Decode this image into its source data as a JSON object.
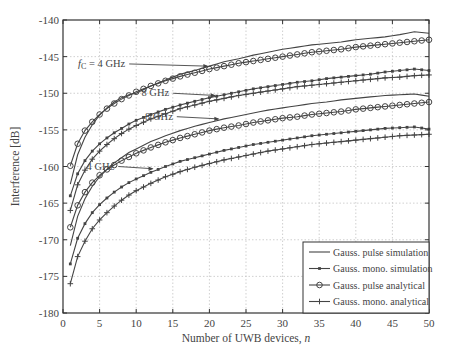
{
  "chart_data": {
    "type": "line",
    "title": "",
    "xlabel": "Number of UWB devices, n",
    "ylabel": "Interference [dB]",
    "xlim": [
      0,
      50
    ],
    "ylim": [
      -180,
      -140
    ],
    "xticks": [
      0,
      5,
      10,
      15,
      20,
      25,
      30,
      35,
      40,
      45,
      50
    ],
    "yticks": [
      -180,
      -175,
      -170,
      -165,
      -160,
      -155,
      -150,
      -145,
      -140
    ],
    "grid": true,
    "legend_position": "lower right",
    "legend": [
      {
        "label": "Gauss. pulse simulation",
        "marker": "none"
      },
      {
        "label": "Gauss. mono. simulation",
        "marker": "x"
      },
      {
        "label": "Gauss. pulse analytical",
        "marker": "o"
      },
      {
        "label": "Gauss. mono. analytical",
        "marker": "+"
      }
    ],
    "annotations": [
      {
        "text": "f_c = 4 GHz",
        "x": 20,
        "y": -146.3,
        "label_at": [
          8.5,
          -146.0
        ]
      },
      {
        "text": "8 GHz",
        "x": 21,
        "y": -150.3,
        "label_at": [
          14.5,
          -150.0
        ]
      },
      {
        "text": "8 GHz",
        "x": 21.5,
        "y": -153.5,
        "label_at": [
          15.0,
          -153.2
        ]
      },
      {
        "text": "4 GHz",
        "x": 12.5,
        "y": -160.3,
        "label_at": [
          7.0,
          -160.0
        ]
      }
    ],
    "x": [
      1,
      2,
      3,
      4,
      5,
      6,
      7,
      8,
      9,
      10,
      12,
      14,
      16,
      18,
      20,
      22,
      24,
      26,
      28,
      30,
      32,
      34,
      36,
      38,
      40,
      42,
      44,
      46,
      48,
      50
    ],
    "series": [
      {
        "name": "Gauss. pulse simulation (fc = 4 GHz)",
        "group": "fc=4 GHz pulse",
        "values": [
          -162.4,
          -158.4,
          -156.0,
          -154.3,
          -153.0,
          -152.0,
          -151.2,
          -150.6,
          -150.2,
          -150.0,
          -149.0,
          -148.2,
          -147.4,
          -146.9,
          -146.3,
          -145.7,
          -145.3,
          -144.8,
          -144.4,
          -144.0,
          -143.7,
          -143.4,
          -143.2,
          -143.0,
          -142.7,
          -142.5,
          -142.3,
          -142.0,
          -141.6,
          -141.8
        ]
      },
      {
        "name": "Gauss. pulse analytical (fc = 4 GHz)",
        "group": "fc=4 GHz pulse",
        "values": [
          -159.9,
          -156.9,
          -155.1,
          -153.9,
          -152.9,
          -152.1,
          -151.4,
          -150.8,
          -150.3,
          -149.8,
          -149.0,
          -148.3,
          -147.7,
          -147.2,
          -146.7,
          -146.3,
          -145.9,
          -145.6,
          -145.3,
          -145.0,
          -144.7,
          -144.4,
          -144.2,
          -144.0,
          -143.7,
          -143.5,
          -143.3,
          -143.1,
          -142.9,
          -142.7
        ]
      },
      {
        "name": "Gauss. mono. simulation (8 GHz)",
        "group": "8 GHz mono",
        "values": [
          -164.0,
          -161.0,
          -159.2,
          -157.9,
          -156.9,
          -156.1,
          -155.4,
          -154.8,
          -154.2,
          -153.7,
          -152.9,
          -152.2,
          -151.6,
          -151.1,
          -150.6,
          -150.2,
          -149.8,
          -149.4,
          -149.1,
          -148.8,
          -148.5,
          -148.3,
          -148.0,
          -147.8,
          -147.6,
          -147.4,
          -147.1,
          -146.9,
          -146.7,
          -146.9
        ]
      },
      {
        "name": "Gauss. mono. analytical (8 GHz)",
        "group": "8 GHz mono",
        "values": [
          -166.0,
          -162.5,
          -160.5,
          -159.0,
          -157.9,
          -157.0,
          -156.2,
          -155.5,
          -154.9,
          -154.4,
          -153.5,
          -152.8,
          -152.1,
          -151.6,
          -151.1,
          -150.7,
          -150.3,
          -150.0,
          -149.7,
          -149.4,
          -149.1,
          -148.9,
          -148.7,
          -148.5,
          -148.3,
          -148.1,
          -147.9,
          -147.8,
          -147.6,
          -147.5
        ]
      },
      {
        "name": "Gauss. pulse simulation (8 GHz)",
        "group": "8 GHz pulse",
        "values": [
          -170.8,
          -166.8,
          -164.4,
          -162.7,
          -161.4,
          -160.4,
          -159.5,
          -158.8,
          -158.1,
          -157.6,
          -156.6,
          -155.8,
          -155.1,
          -154.5,
          -154.0,
          -153.5,
          -153.1,
          -152.7,
          -152.3,
          -152.0,
          -151.7,
          -151.4,
          -151.2,
          -150.9,
          -150.7,
          -150.5,
          -150.3,
          -150.2,
          -150.1,
          -150.4
        ]
      },
      {
        "name": "Gauss. pulse analytical (8 GHz)",
        "group": "8 GHz pulse",
        "values": [
          -168.3,
          -165.3,
          -163.5,
          -162.2,
          -161.2,
          -160.4,
          -159.8,
          -159.2,
          -158.7,
          -158.2,
          -157.4,
          -156.7,
          -156.1,
          -155.6,
          -155.1,
          -154.7,
          -154.4,
          -154.0,
          -153.7,
          -153.4,
          -153.2,
          -152.9,
          -152.7,
          -152.5,
          -152.2,
          -152.0,
          -151.8,
          -151.6,
          -151.4,
          -151.2
        ]
      },
      {
        "name": "Gauss. mono. simulation (fc = 4 GHz)",
        "group": "4 GHz mono",
        "values": [
          -173.3,
          -169.8,
          -167.8,
          -166.3,
          -165.2,
          -164.3,
          -163.5,
          -162.8,
          -162.2,
          -161.7,
          -160.8,
          -160.0,
          -159.3,
          -158.8,
          -158.3,
          -157.8,
          -157.4,
          -157.0,
          -156.7,
          -156.4,
          -156.1,
          -155.8,
          -155.6,
          -155.4,
          -155.2,
          -155.0,
          -154.8,
          -154.7,
          -154.6,
          -154.9
        ]
      },
      {
        "name": "Gauss. mono. analytical (fc = 4 GHz)",
        "group": "4 GHz mono",
        "values": [
          -176.0,
          -172.3,
          -170.2,
          -168.5,
          -167.3,
          -166.3,
          -165.4,
          -164.6,
          -163.9,
          -163.3,
          -162.3,
          -161.4,
          -160.7,
          -160.1,
          -159.6,
          -159.1,
          -158.7,
          -158.3,
          -157.9,
          -157.6,
          -157.3,
          -157.0,
          -156.8,
          -156.6,
          -156.4,
          -156.2,
          -156.0,
          -155.8,
          -155.7,
          -155.6
        ]
      }
    ]
  },
  "plot": {
    "px_left": 63,
    "px_right": 429,
    "px_top": 20,
    "px_bottom": 313,
    "line_color": "#444444",
    "grid_color": "#bbbbbb"
  }
}
